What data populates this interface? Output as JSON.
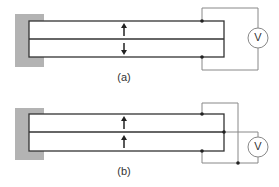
{
  "figure": {
    "panels": [
      {
        "label": "(a)",
        "voltmeter": "V",
        "arrows": [
          "up",
          "down"
        ],
        "description": "Cantilever bimorph, series connection"
      },
      {
        "label": "(b)",
        "voltmeter": "V",
        "arrows": [
          "up",
          "up"
        ],
        "description": "Cantilever bimorph, parallel connection"
      }
    ]
  },
  "colors": {
    "clamp": "#b0b0b0",
    "beam": "#333333",
    "wire": "#888888"
  }
}
